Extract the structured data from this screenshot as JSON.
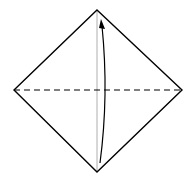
{
  "diagram": {
    "type": "origami-fold-step",
    "colors": {
      "background": "#ffffff",
      "outline": "#000000",
      "crease": "#999999",
      "fold_line": "#000000",
      "arrow": "#000000"
    },
    "paper": {
      "top": [
        97,
        10
      ],
      "right": [
        182,
        90
      ],
      "bottom": [
        97,
        172
      ],
      "left": [
        14,
        90
      ]
    },
    "crease_line": {
      "from": [
        97,
        10
      ],
      "to": [
        97,
        172
      ]
    },
    "fold_line": {
      "from": [
        14,
        90
      ],
      "to": [
        182,
        90
      ],
      "style": "dashed"
    },
    "arrow": {
      "from": [
        100,
        163
      ],
      "to": [
        101,
        20
      ],
      "direction": "up"
    }
  }
}
